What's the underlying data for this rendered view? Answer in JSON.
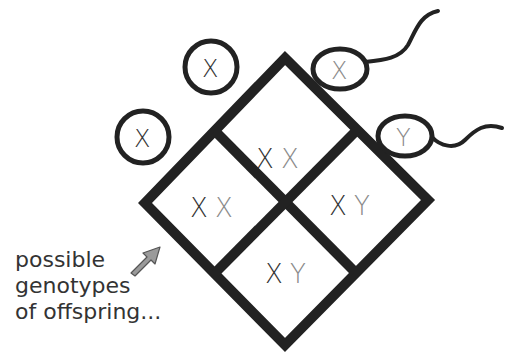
{
  "diagram": {
    "type": "punnett-square",
    "colors": {
      "line": "#222222",
      "dark_allele": "#333333",
      "light_allele": "#8a8a8a",
      "arrow_fill": "#9a9a9a"
    },
    "female_gametes": [
      {
        "allele": "X"
      },
      {
        "allele": "X"
      }
    ],
    "male_gametes": [
      {
        "allele": "X"
      },
      {
        "allele": "Y"
      }
    ],
    "cells": [
      {
        "position": "top",
        "maternal": "X",
        "paternal": "X"
      },
      {
        "position": "left",
        "maternal": "X",
        "paternal": "X"
      },
      {
        "position": "right",
        "maternal": "X",
        "paternal": "Y"
      },
      {
        "position": "bottom",
        "maternal": "X",
        "paternal": "Y"
      }
    ],
    "caption_lines": [
      "possible",
      "genotypes",
      "of offspring..."
    ],
    "arrow_icon": "arrow-up-right-icon"
  }
}
